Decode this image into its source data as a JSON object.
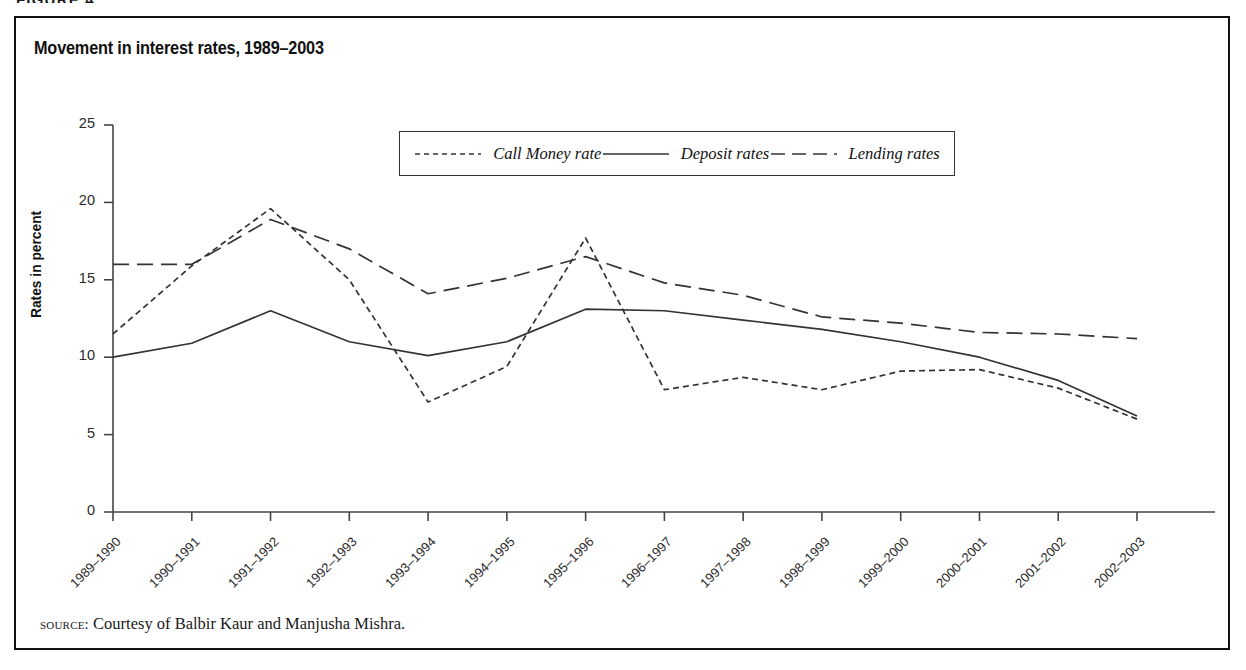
{
  "figure": {
    "caption": "FIGURE 4",
    "source_prefix": "source:",
    "source_text": "Courtesy of Balbir Kaur and Manjusha Mishra."
  },
  "chart_data": {
    "type": "line",
    "title": "Movement in interest rates, 1989–2003",
    "xlabel": "",
    "ylabel": "Rates in percent",
    "ylim": [
      0,
      25
    ],
    "yticks": [
      0,
      5,
      10,
      15,
      20,
      25
    ],
    "grid": false,
    "legend_position": "top-center",
    "categories": [
      "1989–1990",
      "1990–1991",
      "1991–1992",
      "1992–1993",
      "1993–1994",
      "1994–1995",
      "1995–1996",
      "1996–1997",
      "1997–1998",
      "1998–1999",
      "1999–2000",
      "2000–2001",
      "2001–2002",
      "2002–2003"
    ],
    "series": [
      {
        "name": "Call  Money rate",
        "style": "dotted",
        "color": "#333333",
        "values": [
          11.5,
          15.9,
          19.6,
          15.0,
          7.1,
          9.4,
          17.7,
          7.9,
          8.7,
          7.9,
          9.1,
          9.2,
          8.0,
          6.0
        ]
      },
      {
        "name": "Deposit rates",
        "style": "solid",
        "color": "#333333",
        "values": [
          10.0,
          10.9,
          13.0,
          11.0,
          10.1,
          11.0,
          13.1,
          13.0,
          12.4,
          11.8,
          11.0,
          10.0,
          8.5,
          6.2
        ]
      },
      {
        "name": "Lending rates",
        "style": "dashed",
        "color": "#333333",
        "values": [
          16.0,
          16.0,
          18.9,
          17.0,
          14.1,
          15.1,
          16.5,
          14.8,
          14.0,
          12.6,
          12.2,
          11.6,
          11.5,
          11.2
        ]
      }
    ]
  }
}
